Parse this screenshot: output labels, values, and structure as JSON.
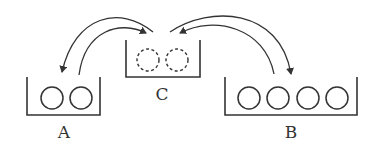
{
  "diagram": {
    "type": "container-transfer",
    "colors": {
      "stroke": "#333333",
      "background": "#ffffff"
    },
    "containers": [
      {
        "id": "A",
        "label": "A",
        "balls": 2,
        "ball_style": "solid"
      },
      {
        "id": "C",
        "label": "C",
        "balls": 2,
        "ball_style": "dashed"
      },
      {
        "id": "B",
        "label": "B",
        "balls": 4,
        "ball_style": "solid"
      }
    ],
    "arrows": [
      {
        "from": "C",
        "to": "A"
      },
      {
        "from": "A",
        "to": "C"
      },
      {
        "from": "B",
        "to": "C"
      },
      {
        "from": "C",
        "to": "B"
      }
    ]
  }
}
